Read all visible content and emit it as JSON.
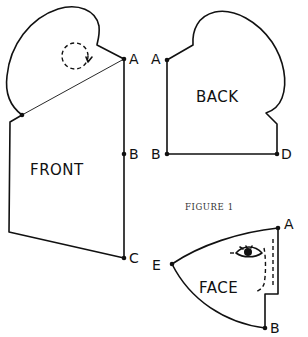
{
  "figure": {
    "caption": "FIGURE 1"
  },
  "pieces": {
    "front": {
      "title": "FRONT",
      "points": {
        "A": "A",
        "B": "B",
        "C": "C"
      }
    },
    "back": {
      "title": "BACK",
      "points": {
        "A": "A",
        "B": "B",
        "D": "D"
      }
    },
    "face": {
      "title": "FACE",
      "points": {
        "A": "A",
        "E": "E",
        "B": "B"
      }
    }
  },
  "colors": {
    "line": "#111111",
    "background": "#ffffff"
  }
}
